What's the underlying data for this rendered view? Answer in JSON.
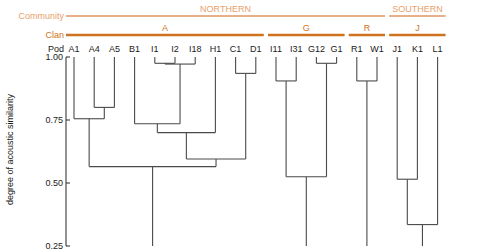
{
  "figure": {
    "ylabel": "degree of acoustic similarity",
    "row_labels": {
      "community": "Community",
      "clan": "Clan",
      "pod": "Pod"
    },
    "colors": {
      "community_bar": "#e8b08a",
      "community_text": "#e8a06a",
      "clan_bar": "#cf7320",
      "clan_text": "#cf7320",
      "tree": "#4a4a4a",
      "axis": "#3a3a3a",
      "text": "#1a1a1a"
    }
  },
  "chart_data": {
    "type": "dendrogram",
    "title": "",
    "xlabel": "",
    "ylabel": "degree of acoustic similarity",
    "ylim": [
      0.25,
      1.0
    ],
    "y_direction": "descending",
    "yticks": [
      "1.00",
      "0.75",
      "0.50",
      "0.25"
    ],
    "ytick_values": [
      1.0,
      0.75,
      0.5,
      0.25
    ],
    "grid": false,
    "legend": "none",
    "leaves": [
      "A1",
      "A4",
      "A5",
      "B1",
      "I1",
      "I2",
      "I18",
      "H1",
      "C1",
      "D1",
      "I11",
      "I31",
      "G12",
      "G1",
      "R1",
      "W1",
      "J1",
      "K1",
      "L1"
    ],
    "communities": [
      {
        "label": "NORTHERN",
        "leaves": [
          "A1",
          "A4",
          "A5",
          "B1",
          "I1",
          "I2",
          "I18",
          "H1",
          "C1",
          "D1",
          "I11",
          "I31",
          "G12",
          "G1",
          "R1",
          "W1"
        ]
      },
      {
        "label": "SOUTHERN",
        "leaves": [
          "J1",
          "K1",
          "L1"
        ]
      }
    ],
    "clans": [
      {
        "label": "A",
        "leaves": [
          "A1",
          "A4",
          "A5",
          "B1",
          "I1",
          "I2",
          "I18",
          "H1",
          "C1",
          "D1"
        ]
      },
      {
        "label": "G",
        "leaves": [
          "I11",
          "I31",
          "G12",
          "G1"
        ]
      },
      {
        "label": "R",
        "leaves": [
          "R1",
          "W1"
        ]
      },
      {
        "label": "J",
        "leaves": [
          "J1",
          "K1",
          "L1"
        ]
      }
    ],
    "merges": [
      {
        "id": "m1",
        "children": [
          "A4",
          "A5"
        ],
        "height": 0.8
      },
      {
        "id": "m2",
        "children": [
          "A1",
          "m1"
        ],
        "height": 0.755
      },
      {
        "id": "m3",
        "children": [
          "I1",
          "I2"
        ],
        "height": 0.975
      },
      {
        "id": "m4",
        "children": [
          "m3",
          "I18"
        ],
        "height": 0.972
      },
      {
        "id": "m5",
        "children": [
          "B1",
          "m4"
        ],
        "height": 0.735
      },
      {
        "id": "m6",
        "children": [
          "m5",
          "H1"
        ],
        "height": 0.7
      },
      {
        "id": "m7",
        "children": [
          "C1",
          "D1"
        ],
        "height": 0.935
      },
      {
        "id": "m8",
        "children": [
          "m6",
          "m7"
        ],
        "height": 0.595
      },
      {
        "id": "m9",
        "children": [
          "m2",
          "m8"
        ],
        "height": 0.565
      },
      {
        "id": "m10",
        "children": [
          "I11",
          "I31"
        ],
        "height": 0.905
      },
      {
        "id": "m11",
        "children": [
          "G12",
          "G1"
        ],
        "height": 0.975
      },
      {
        "id": "m12",
        "children": [
          "m10",
          "m11"
        ],
        "height": 0.525
      },
      {
        "id": "m13",
        "children": [
          "R1",
          "W1"
        ],
        "height": 0.905
      },
      {
        "id": "m14",
        "children": [
          "J1",
          "K1"
        ],
        "height": 0.515
      },
      {
        "id": "m15",
        "children": [
          "m14",
          "L1"
        ],
        "height": 0.335
      }
    ],
    "root_stems": [
      {
        "node": "m9",
        "extends_to": 0.25
      },
      {
        "node": "m12",
        "extends_to": 0.25
      },
      {
        "node": "m13",
        "extends_to": 0.25
      },
      {
        "node": "m15",
        "extends_to": 0.25
      }
    ]
  }
}
